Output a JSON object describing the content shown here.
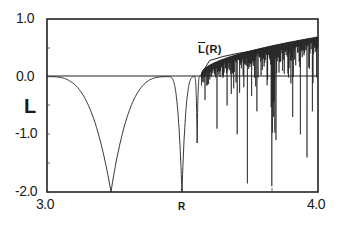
{
  "chart_data": {
    "type": "line",
    "title": "",
    "xlabel": "R",
    "ylabel": "L",
    "xlim": [
      3.0,
      4.0
    ],
    "ylim": [
      -2.0,
      1.0
    ],
    "grid": false,
    "x_tick_labels": [
      "3.0",
      "R",
      "4.0"
    ],
    "y_tick_labels": [
      "1.0",
      "0.0",
      "-1.0",
      "-2.0"
    ],
    "annotations": [
      {
        "text": "L(R)",
        "overline": true,
        "x": 3.56,
        "y": 0.48
      }
    ],
    "reference_line": {
      "y": 0.0
    },
    "series": [
      {
        "name": "Lyapunov exponent L(R)",
        "x": [
          3.0,
          3.05,
          3.1,
          3.15,
          3.2,
          3.236,
          3.27,
          3.3,
          3.35,
          3.4,
          3.44,
          3.47,
          3.49,
          3.498,
          3.51,
          3.54,
          3.554,
          3.565,
          3.57,
          3.6,
          3.65,
          3.7,
          3.74,
          3.8,
          3.828,
          3.84,
          3.86,
          3.9,
          3.95,
          4.0
        ],
        "y": [
          0.0,
          -0.12,
          -0.32,
          -0.62,
          -1.1,
          -2.0,
          -1.05,
          -0.66,
          -0.3,
          -0.1,
          -0.02,
          -0.5,
          -1.3,
          -2.0,
          -0.7,
          -0.15,
          -1.15,
          -0.1,
          0.05,
          0.2,
          0.3,
          0.35,
          0.38,
          0.36,
          0.0,
          -1.9,
          0.4,
          0.48,
          0.55,
          0.69
        ]
      },
      {
        "name": "L̄(R) envelope",
        "x": [
          3.57,
          3.6,
          3.65,
          3.7,
          3.75,
          3.8
        ],
        "y": [
          0.05,
          0.28,
          0.35,
          0.4,
          0.44,
          0.48
        ]
      }
    ],
    "notable_dips": [
      {
        "x": 3.236,
        "y": -2.0
      },
      {
        "x": 3.498,
        "y": -2.0
      },
      {
        "x": 3.554,
        "y": -1.15
      },
      {
        "x": 3.74,
        "y": -1.85
      },
      {
        "x": 3.83,
        "y": -1.9
      },
      {
        "x": 3.96,
        "y": -1.4
      }
    ]
  },
  "labels": {
    "y_top": "1.0",
    "y_zero": "0.0",
    "y_neg1": "-1.0",
    "y_neg2": "-2.0",
    "x_left": "3.0",
    "x_mid": "R",
    "x_right": "4.0",
    "y_axis": "L",
    "annotation": "L",
    "annotation_suffix": "(R)"
  }
}
